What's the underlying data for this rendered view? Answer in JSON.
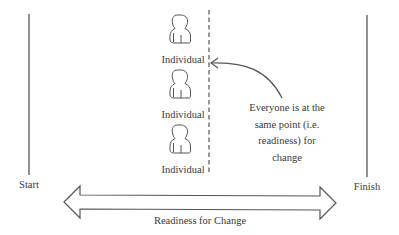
{
  "diagram": {
    "type": "readiness-for-change-illustration",
    "boundaries": {
      "start_label": "Start",
      "finish_label": "Finish"
    },
    "axis": {
      "label": "Readiness for Change",
      "direction": "bidirectional"
    },
    "individuals": [
      {
        "label": "Individual",
        "icon": "person-icon"
      },
      {
        "label": "Individual",
        "icon": "person-icon"
      },
      {
        "label": "Individual",
        "icon": "person-icon"
      }
    ],
    "marker": {
      "style": "dashed-vertical-line",
      "annotation_lines": [
        "Everyone is at the",
        "same point (i.e.",
        "readiness) for",
        "change"
      ]
    },
    "colors": {
      "stroke": "#555555",
      "text": "#3a3a3a",
      "background": "#ffffff"
    }
  }
}
